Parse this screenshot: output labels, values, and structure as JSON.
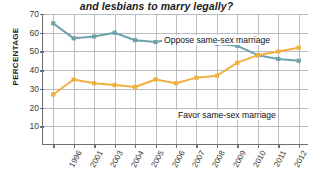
{
  "chart_data": {
    "type": "line",
    "title": "and lesbians to marry legally?",
    "xlabel": "",
    "ylabel": "PERCENTAGE",
    "grid": true,
    "legend_position": "inline-labels",
    "ylim": [
      0,
      70
    ],
    "yticks": [
      70,
      60,
      50,
      40,
      30,
      20,
      10
    ],
    "categories": [
      "1996",
      "2001",
      "2003",
      "2004",
      "2005",
      "2006",
      "2007",
      "2008",
      "2009",
      "2010",
      "2011",
      "2012",
      "2013"
    ],
    "series": [
      {
        "name": "Oppose same-sex marriage",
        "color": "#6fa3ab",
        "values": [
          65,
          57,
          58,
          60,
          56,
          55,
          57,
          56,
          54,
          53,
          48,
          46,
          45
        ]
      },
      {
        "name": "Favor same-sex marriage",
        "color": "#f0b040",
        "values": [
          27,
          35,
          33,
          32,
          31,
          35,
          33,
          36,
          37,
          44,
          48,
          50,
          52
        ]
      }
    ]
  },
  "labels": {
    "oppose": "Oppose same-sex marriage",
    "favor": "Favor same-sex marriage"
  }
}
